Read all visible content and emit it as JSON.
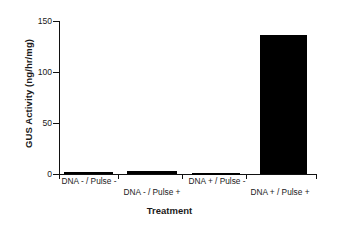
{
  "chart_data": {
    "type": "bar",
    "title": "",
    "subtitle": "",
    "xlabel": "Treatment",
    "ylabel": "GUS Activity (ng/hr/mg)",
    "categories": [
      "DNA - / Pulse -",
      "DNA - / Pulse +",
      "DNA + / Pulse -",
      "DNA + / Pulse +"
    ],
    "values": [
      1.5,
      2.5,
      0.8,
      136
    ],
    "ylim": [
      0,
      150
    ],
    "yticks": [
      0,
      50,
      100,
      150
    ],
    "ytick_labels": [
      "0",
      "50",
      "100",
      "150"
    ],
    "grid": false,
    "legend": false,
    "bar_color": "#000000",
    "axis_color": "#111111",
    "background": "#ffffff",
    "label_stagger": [
      "top",
      "bottom",
      "top",
      "bottom"
    ]
  }
}
